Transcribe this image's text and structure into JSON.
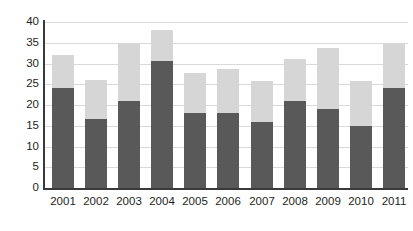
{
  "chart_data": {
    "type": "bar",
    "stacked": true,
    "title": "",
    "subtitle": "",
    "xlabel": "",
    "ylabel": "",
    "categories": [
      "2001",
      "2002",
      "2003",
      "2004",
      "2005",
      "2006",
      "2007",
      "2008",
      "2009",
      "2010",
      "2011"
    ],
    "series": [
      {
        "name": "lower-segment",
        "color": "#595959",
        "values": [
          24,
          16.7,
          21,
          30.5,
          18,
          18,
          16,
          21,
          19,
          15,
          24
        ]
      },
      {
        "name": "upper-segment",
        "color": "#d6d6d6",
        "values": [
          8,
          9.3,
          14,
          7.5,
          9.7,
          10.7,
          9.8,
          10,
          14.7,
          10.8,
          11
        ]
      }
    ],
    "totals": [
      32,
      26,
      35,
      38,
      27.7,
      28.7,
      25.8,
      31,
      33.7,
      25.8,
      35
    ],
    "ylim": [
      0,
      40
    ],
    "y_ticks": [
      0,
      5,
      10,
      15,
      20,
      25,
      30,
      35,
      40
    ],
    "y_tick_labels": [
      "0",
      "5",
      "10",
      "15",
      "20",
      "25",
      "30",
      "35",
      "40"
    ],
    "grid": true,
    "grid_axis": "y",
    "legend": false,
    "legend_position": "none",
    "annotations": []
  },
  "colors": {
    "background": "#ffffff",
    "gridline": "#d9d9d9",
    "axis": "#3a3a3a",
    "text": "#231f20",
    "segment_lower": "#595959",
    "segment_upper": "#d6d6d6"
  }
}
